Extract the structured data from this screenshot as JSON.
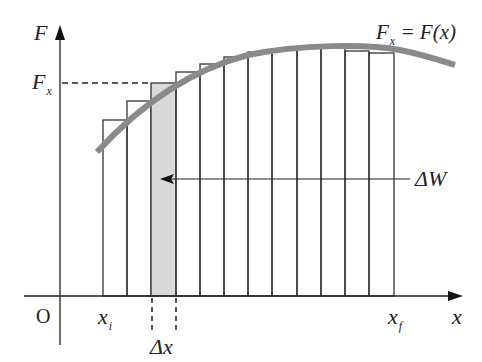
{
  "diagram": {
    "axes": {
      "y_label": "F",
      "x_label": "x",
      "origin_label": "O"
    },
    "labels": {
      "curve_main": "F",
      "curve_sub": "x",
      "curve_rest": " = F(x)",
      "fx_main": "F",
      "fx_sub": "x",
      "xi_main": "x",
      "xi_sub": "i",
      "xf_main": "x",
      "xf_sub": "f",
      "dx": "Δx",
      "dw": "ΔW"
    },
    "colors": {
      "curve": "#8a8a8a",
      "bar_stroke": "#333333",
      "highlight_fill": "#d9d9d9",
      "axis": "#222222"
    }
  },
  "chart_data": {
    "type": "bar",
    "xlabel": "x",
    "ylabel": "F",
    "bar_edges_px": [
      103,
      127,
      151,
      176,
      200,
      224,
      248,
      272,
      297,
      321,
      345,
      369,
      394
    ],
    "bar_tops_px": [
      120,
      101,
      83,
      72,
      64,
      57,
      52,
      49,
      48,
      48,
      51,
      53
    ],
    "highlighted_bar_index": 2,
    "annotations": [
      "F_x",
      "x_i",
      "x_f",
      "Δx",
      "ΔW"
    ]
  }
}
